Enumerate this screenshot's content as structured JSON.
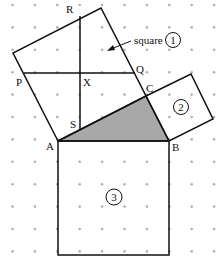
{
  "diagram": {
    "colors": {
      "line": "#111111",
      "dot": "#b0b0b0",
      "shade": "#a8a8a8",
      "background": "#ffffff"
    },
    "grid": {
      "x0": 12.5,
      "y0": 5,
      "spacing": 22.4,
      "cols": 10,
      "rows": 12
    },
    "points": {
      "A": {
        "label": "A",
        "x": 58,
        "y": 141
      },
      "B": {
        "label": "B",
        "x": 169,
        "y": 141
      },
      "C": {
        "label": "C",
        "x": 146,
        "y": 96
      },
      "P": {
        "label": "P",
        "x": 24,
        "y": 73
      },
      "Q": {
        "label": "Q",
        "x": 135,
        "y": 73
      },
      "R": {
        "label": "R",
        "x": 80,
        "y": 16
      },
      "S": {
        "label": "S",
        "x": 80,
        "y": 130
      },
      "X": {
        "label": "X",
        "x": 80,
        "y": 73
      }
    },
    "annotation": {
      "text": "square",
      "number": "1"
    },
    "squares": [
      {
        "id": "1",
        "label": "1"
      },
      {
        "id": "2",
        "label": "2"
      },
      {
        "id": "3",
        "label": "3"
      }
    ]
  }
}
